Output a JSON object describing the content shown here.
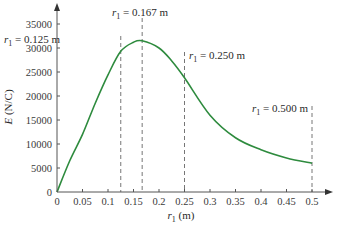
{
  "chart_data": {
    "type": "line",
    "title": "",
    "xlabel": "r1 (m)",
    "ylabel": "E (N/C)",
    "xlim": [
      0,
      0.5
    ],
    "ylim": [
      0,
      35000
    ],
    "grid": false,
    "legend": null,
    "x_ticks": [
      "0",
      "0.05",
      "0.1",
      "0.15",
      "0.2",
      "0.25",
      "0.3",
      "0.35",
      "0.4",
      "0.45",
      "0.5"
    ],
    "y_ticks": [
      "0",
      "5000",
      "10000",
      "15000",
      "20000",
      "25000",
      "30000",
      "35000"
    ],
    "series": [
      {
        "name": "E",
        "color": "#2e8b3e",
        "x": [
          0,
          0.025,
          0.05,
          0.075,
          0.1,
          0.125,
          0.15,
          0.167,
          0.2,
          0.225,
          0.25,
          0.3,
          0.35,
          0.4,
          0.45,
          0.5
        ],
        "y": [
          0,
          6500,
          12000,
          18500,
          24400,
          29300,
          31200,
          31500,
          30000,
          27300,
          23800,
          16000,
          11300,
          8800,
          7100,
          6000
        ]
      }
    ],
    "annotations": [
      {
        "x": 0.125,
        "label_main": "r",
        "label_sub": "1",
        "label_rest": " = 0.125 m"
      },
      {
        "x": 0.167,
        "label_main": "r",
        "label_sub": "1",
        "label_rest": " = 0.167 m"
      },
      {
        "x": 0.25,
        "label_main": "r",
        "label_sub": "1",
        "label_rest": " = 0.250 m"
      },
      {
        "x": 0.5,
        "label_main": "r",
        "label_sub": "1",
        "label_rest": " = 0.500 m"
      }
    ]
  },
  "axis": {
    "x_title_main": "r",
    "x_title_sub": "1",
    "x_title_rest": " (m)",
    "y_title_main": "E",
    "y_title_rest": " (N/C)"
  }
}
